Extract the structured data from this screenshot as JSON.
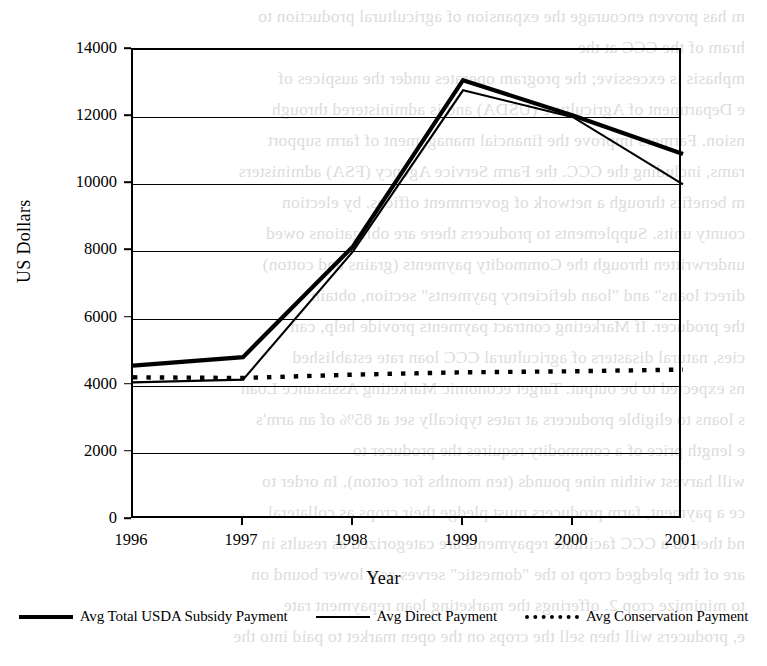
{
  "chart_data": {
    "type": "line",
    "title": "",
    "xlabel": "Year",
    "ylabel": "US Dollars",
    "categories": [
      "1996",
      "1997",
      "1998",
      "1999",
      "2000",
      "2001"
    ],
    "x": [
      1996,
      1997,
      1998,
      1999,
      2000,
      2001
    ],
    "xlim": [
      1996,
      2001
    ],
    "ylim": [
      0,
      14000
    ],
    "yticks": [
      0,
      2000,
      4000,
      6000,
      8000,
      10000,
      12000,
      14000
    ],
    "ytick_labels": [
      "0",
      "2000",
      "4000",
      "6000",
      "8000",
      "10000",
      "12000",
      "14000"
    ],
    "grid": "horizontal",
    "legend_position": "bottom",
    "series": [
      {
        "name": "Avg Total USDA Subsidy Payment",
        "style": "solid-thick",
        "color": "#000000",
        "values": [
          4600,
          4850,
          8150,
          13100,
          12050,
          10900
        ]
      },
      {
        "name": "Avg Direct Payment",
        "style": "solid-thin",
        "color": "#000000",
        "values": [
          4100,
          4180,
          8000,
          12800,
          12000,
          10000
        ]
      },
      {
        "name": "Avg Conservation Payment",
        "style": "dotted",
        "color": "#000000",
        "values": [
          4250,
          4230,
          4330,
          4400,
          4430,
          4480
        ]
      }
    ]
  },
  "background_bleed": {
    "note": "faint mirrored show-through text from reverse of scanned page",
    "lines": [
      "m has proven encourage the expansion of agricultural production to",
      "hram of the CCC at the",
      "mphasis is excessive; the program operates under the auspices of",
      "e Department of Agriculture (USDA) and is administered through",
      "nsion. Farmers improve the financial management of farm support",
      "rams, including the CCC. the Farm Service Agency (FSA) administers",
      "m benefits through a network of government offices. by election",
      "county units. Supplements to producers there are obligations owed",
      "underwritten through the Commodity payments (grains and cotton)",
      "direct loans\" and \"loan deficiency payments\" section, obtain",
      "the producer. If Marketing contract payments provide help, can",
      "cies, natural disasters of agricultural CCC loan rate established",
      "ns expected to be output. Target economic Marketing Assistance Loan",
      "s loans to eligible producers at rates typically set at 85% of an arm's",
      "e length price of a commodity requires the producer to",
      "will harvest within nine pounds (ten months for cotton). In order to",
      "ce a payment, farm producers must pledge their crops as collateral",
      "nd then to a CCC facilitate repayments are categorized as results in",
      "are of the pledged crop to the \"domestic\" serves as a lower bound on",
      "to minimize crop 2. offerings the marketing loan repayment rate",
      "e, producers will then sell the crops on the open market to paid into the"
    ]
  }
}
